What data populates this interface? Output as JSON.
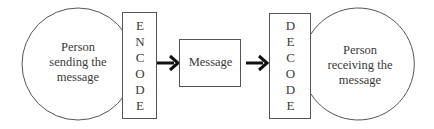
{
  "diagram": {
    "type": "communication-process",
    "sender": {
      "label_lines": [
        "Person",
        "sending the",
        "message"
      ]
    },
    "encode": {
      "letters": [
        "E",
        "N",
        "C",
        "O",
        "D",
        "E"
      ]
    },
    "message": {
      "label": "Message"
    },
    "decode": {
      "letters": [
        "D",
        "E",
        "C",
        "O",
        "D",
        "E"
      ]
    },
    "receiver": {
      "label_lines": [
        "Person",
        "receiving the",
        "message"
      ]
    },
    "edges": [
      {
        "from": "encode",
        "to": "message",
        "style": "bold-arrow"
      },
      {
        "from": "message",
        "to": "decode",
        "style": "bold-arrow"
      }
    ],
    "colors": {
      "stroke": "#555555",
      "arrow": "#111111",
      "background": "#ffffff"
    }
  }
}
